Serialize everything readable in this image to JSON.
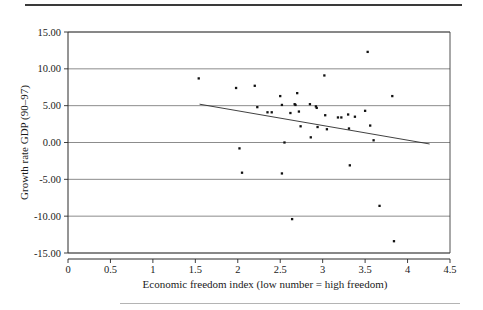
{
  "chart_data": {
    "type": "scatter",
    "title": "",
    "subtitle": "",
    "xlabel": "Economic freedom index (low number = high freedom)",
    "ylabel": "Growth rate GDP (90–97)",
    "xlim": [
      0,
      4.5
    ],
    "ylim": [
      -15,
      15
    ],
    "xticks": [
      0,
      0.5,
      1,
      1.5,
      2,
      2.5,
      3,
      3.5,
      4,
      4.5
    ],
    "xtick_labels": [
      "0",
      "0.5",
      "1",
      "1.5",
      "2",
      "2.5",
      "3",
      "3.5",
      "4",
      "4.5"
    ],
    "yticks": [
      15,
      10,
      5,
      0,
      -5,
      -10,
      -15
    ],
    "ytick_labels": [
      "15.00",
      "10.00",
      "5.00",
      "0.00",
      "-5.00",
      "-10.00",
      "-15.00"
    ],
    "grid": "horizontal",
    "legend": "none",
    "marker": "filled-square-dot",
    "point_color": "#111111",
    "series": [
      {
        "name": "Countries",
        "points": [
          [
            1.54,
            8.7
          ],
          [
            1.98,
            7.4
          ],
          [
            2.02,
            -0.8
          ],
          [
            2.05,
            -4.1
          ],
          [
            2.2,
            7.7
          ],
          [
            2.23,
            4.8
          ],
          [
            2.35,
            4.1
          ],
          [
            2.4,
            4.1
          ],
          [
            2.5,
            6.3
          ],
          [
            2.52,
            5.1
          ],
          [
            2.52,
            -4.2
          ],
          [
            2.55,
            0.0
          ],
          [
            2.62,
            4.0
          ],
          [
            2.64,
            -10.4
          ],
          [
            2.67,
            5.2
          ],
          [
            2.68,
            5.1
          ],
          [
            2.7,
            6.7
          ],
          [
            2.72,
            4.2
          ],
          [
            2.74,
            2.2
          ],
          [
            2.85,
            5.2
          ],
          [
            2.86,
            0.7
          ],
          [
            2.92,
            4.9
          ],
          [
            2.93,
            4.7
          ],
          [
            2.94,
            2.1
          ],
          [
            3.02,
            9.1
          ],
          [
            3.03,
            3.7
          ],
          [
            3.05,
            1.8
          ],
          [
            3.18,
            3.4
          ],
          [
            3.22,
            3.4
          ],
          [
            3.3,
            3.8
          ],
          [
            3.31,
            1.9
          ],
          [
            3.32,
            -3.1
          ],
          [
            3.38,
            3.5
          ],
          [
            3.5,
            4.3
          ],
          [
            3.53,
            12.3
          ],
          [
            3.56,
            2.3
          ],
          [
            3.6,
            0.3
          ],
          [
            3.67,
            -8.6
          ],
          [
            3.82,
            6.3
          ],
          [
            3.84,
            -13.4
          ]
        ]
      }
    ],
    "trendline": {
      "name": "linear fit",
      "x_start": 1.55,
      "y_start": 5.2,
      "x_end": 4.26,
      "y_end": -0.2,
      "color": "#2b2b2b"
    }
  }
}
